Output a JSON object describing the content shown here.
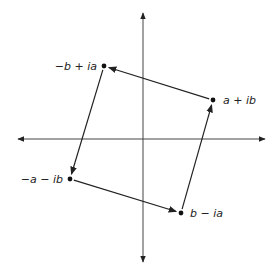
{
  "diagram": {
    "axes": {
      "origin": [
        143,
        139
      ],
      "x_range": [
        18,
        265
      ],
      "y_range": [
        13,
        262
      ],
      "color": "#444444"
    },
    "points": [
      {
        "id": "p1",
        "label": "a + ib",
        "x": 213,
        "y": 100,
        "label_x": 223,
        "label_y": 104,
        "anchor": "start"
      },
      {
        "id": "p2",
        "label": "−b + ia",
        "x": 104,
        "y": 66,
        "label_x": 97,
        "label_y": 70,
        "anchor": "end"
      },
      {
        "id": "p3",
        "label": "−a − ib",
        "x": 70,
        "y": 179,
        "label_x": 63,
        "label_y": 183,
        "anchor": "end"
      },
      {
        "id": "p4",
        "label": "b − ia",
        "x": 181,
        "y": 213,
        "label_x": 190,
        "label_y": 217,
        "anchor": "start"
      }
    ],
    "arrows": [
      {
        "from": "p1",
        "to": "p2"
      },
      {
        "from": "p2",
        "to": "p3"
      },
      {
        "from": "p3",
        "to": "p4"
      },
      {
        "from": "p4",
        "to": "p1"
      }
    ],
    "line_color": "#222222"
  }
}
